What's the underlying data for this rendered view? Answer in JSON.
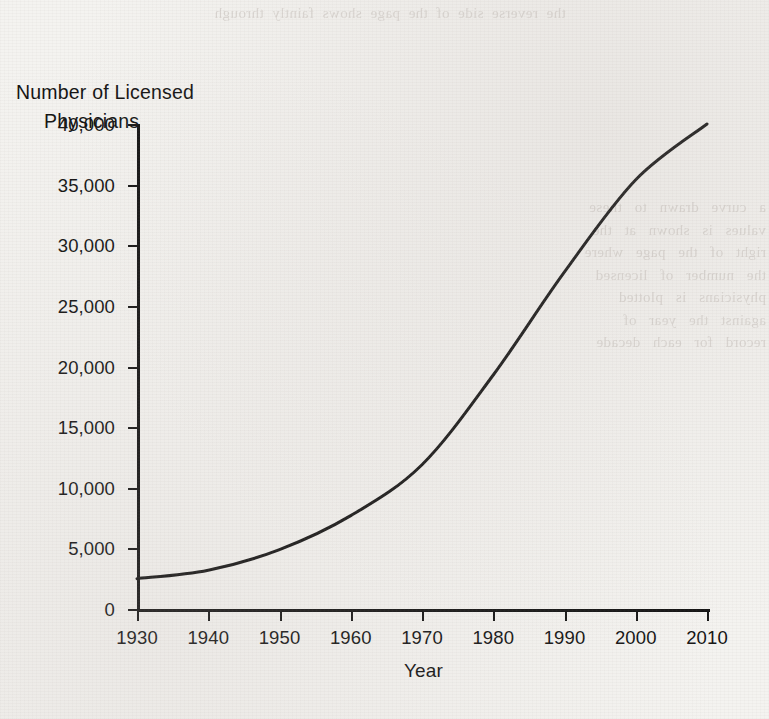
{
  "chart_data": {
    "type": "line",
    "title": "Number of Licensed Physicians",
    "title_line1": "Number of Licensed",
    "title_line2": "Physicians",
    "xlabel": "Year",
    "ylabel": "Number of Licensed Physicians",
    "x": [
      1930,
      1940,
      1950,
      1960,
      1970,
      1980,
      1990,
      2000,
      2010
    ],
    "values": [
      2500,
      3200,
      4900,
      7700,
      11900,
      19300,
      27800,
      35400,
      40000
    ],
    "categories": [
      "1930",
      "1940",
      "1950",
      "1960",
      "1970",
      "1980",
      "1990",
      "2000",
      "2010"
    ],
    "xlim": [
      1930,
      2010
    ],
    "ylim": [
      0,
      40000
    ],
    "xticks": [
      1930,
      1940,
      1950,
      1960,
      1970,
      1980,
      1990,
      2000,
      2010
    ],
    "xtick_labels": [
      "1930",
      "1940",
      "1950",
      "1960",
      "1970",
      "1980",
      "1990",
      "2000",
      "2010"
    ],
    "yticks": [
      0,
      5000,
      10000,
      15000,
      20000,
      25000,
      30000,
      35000,
      40000
    ],
    "ytick_labels": [
      "0",
      "5,000",
      "10,000",
      "15,000",
      "20,000",
      "25,000",
      "30,000",
      "35,000",
      "40,000"
    ],
    "grid": false,
    "legend": false,
    "line_color": "#121212",
    "line_width": 3,
    "background_color": "#f4f3f0"
  },
  "bleed_through": {
    "top": "the  reverse  side  of  the  page  shows  faintly  through",
    "right": "a   curve   drawn   to   these\nvalues   is   shown   at   the\nright   of   the   page   where\nthe   number   of   licensed\nphysicians   is   plotted\nagainst   the   year   of\nrecord   for   each   decade"
  }
}
